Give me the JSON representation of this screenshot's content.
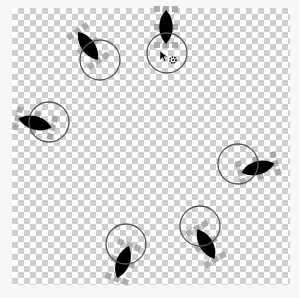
{
  "editor": {
    "canvas_name": "sprite-editor-canvas",
    "background": "transparent-checkerboard",
    "colors": {
      "checker_dark": "#cfcfcf",
      "checker_light": "#ffffff",
      "sprite_fill": "#000000",
      "handle_color": "#a0a0a0",
      "ring_color": "#555555"
    }
  },
  "sprites": [
    {
      "id": "leaf-1",
      "cx": 88,
      "cy": 46,
      "angle": -35,
      "ring_cx": 100,
      "ring_cy": 60,
      "ring_r": 20
    },
    {
      "id": "leaf-2",
      "cx": 166,
      "cy": 27,
      "angle": 0,
      "ring_cx": 167,
      "ring_cy": 53,
      "ring_r": 20,
      "selected": true
    },
    {
      "id": "leaf-3",
      "cx": 35,
      "cy": 123,
      "angle": -75,
      "ring_cx": 49,
      "ring_cy": 122,
      "ring_r": 20
    },
    {
      "id": "leaf-4",
      "cx": 258,
      "cy": 168,
      "angle": 75,
      "ring_cx": 238,
      "ring_cy": 164,
      "ring_r": 20
    },
    {
      "id": "leaf-5",
      "cx": 206,
      "cy": 244,
      "angle": 150,
      "ring_cx": 200,
      "ring_cy": 226,
      "ring_r": 20
    },
    {
      "id": "leaf-6",
      "cx": 123,
      "cy": 262,
      "angle": 200,
      "ring_cx": 126,
      "ring_cy": 244,
      "ring_r": 20
    }
  ],
  "pivot_icon": {
    "name": "rotation-pivot",
    "x": 173,
    "y": 60
  },
  "cursor": {
    "name": "mouse-pointer",
    "x": 160,
    "y": 51
  }
}
